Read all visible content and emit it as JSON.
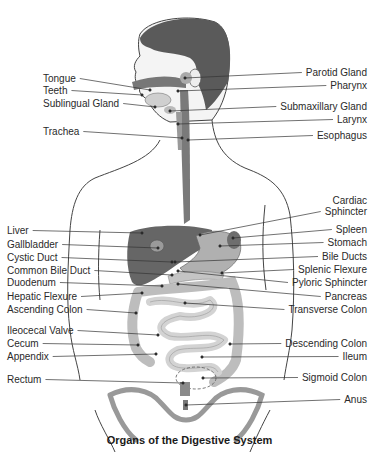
{
  "diagram": {
    "caption": "Organs of the Digestive System",
    "colors": {
      "hair": "#555555",
      "organ_dark": "#666666",
      "organ_mid": "#9a9a9a",
      "intestine": "#d6d6d6",
      "outline": "#444444",
      "leader": "#333333"
    },
    "left_labels": [
      {
        "id": "tongue",
        "text": "Tongue",
        "x": 43,
        "y": 78,
        "px": 150,
        "py": 90
      },
      {
        "id": "teeth",
        "text": "Teeth",
        "x": 43,
        "y": 90,
        "px": 142,
        "py": 95
      },
      {
        "id": "sublingual-gland",
        "text": "Sublingual Gland",
        "x": 43,
        "y": 103,
        "px": 155,
        "py": 107
      },
      {
        "id": "trachea",
        "text": "Trachea",
        "x": 43,
        "y": 131,
        "px": 182,
        "py": 138
      },
      {
        "id": "liver",
        "text": "Liver",
        "x": 7,
        "y": 230,
        "px": 142,
        "py": 233
      },
      {
        "id": "gallbladder",
        "text": "Gallbladder",
        "x": 7,
        "y": 244,
        "px": 158,
        "py": 248
      },
      {
        "id": "cystic-duct",
        "text": "Cystic Duct",
        "x": 7,
        "y": 257,
        "px": 172,
        "py": 262
      },
      {
        "id": "common-bile-duct",
        "text": "Common Bile Duct",
        "x": 7,
        "y": 270,
        "px": 172,
        "py": 275
      },
      {
        "id": "duodenum",
        "text": "Duodenum",
        "x": 7,
        "y": 282,
        "px": 162,
        "py": 286
      },
      {
        "id": "hepatic-flexure",
        "text": "Hepatic Flexure",
        "x": 7,
        "y": 296,
        "px": 142,
        "py": 293
      },
      {
        "id": "ascending-colon",
        "text": "Ascending Colon",
        "x": 7,
        "y": 309,
        "px": 136,
        "py": 313
      },
      {
        "id": "ileocecal-valve",
        "text": "Ileocecal Valve",
        "x": 7,
        "y": 330,
        "px": 158,
        "py": 335
      },
      {
        "id": "cecum",
        "text": "Cecum",
        "x": 7,
        "y": 343,
        "px": 138,
        "py": 345
      },
      {
        "id": "appendix",
        "text": "Appendix",
        "x": 7,
        "y": 356,
        "px": 156,
        "py": 354
      },
      {
        "id": "rectum",
        "text": "Rectum",
        "x": 7,
        "y": 379,
        "px": 183,
        "py": 383
      }
    ],
    "right_labels": [
      {
        "id": "parotid-gland",
        "text": "Parotid Gland",
        "x": 367,
        "y": 72,
        "px": 185,
        "py": 78
      },
      {
        "id": "pharynx",
        "text": "Pharynx",
        "x": 367,
        "y": 85,
        "px": 178,
        "py": 91
      },
      {
        "id": "submaxillary-gland",
        "text": "Submaxillary Gland",
        "x": 367,
        "y": 106,
        "px": 170,
        "py": 111
      },
      {
        "id": "larynx",
        "text": "Larynx",
        "x": 367,
        "y": 119,
        "px": 178,
        "py": 124
      },
      {
        "id": "esophagus",
        "text": "Esophagus",
        "x": 367,
        "y": 135,
        "px": 188,
        "py": 140
      },
      {
        "id": "cardiac-sphincter",
        "text": "Cardiac\nSphincter",
        "x": 367,
        "y": 200,
        "px": 200,
        "py": 235
      },
      {
        "id": "spleen",
        "text": "Spleen",
        "x": 367,
        "y": 229,
        "px": 233,
        "py": 238
      },
      {
        "id": "stomach",
        "text": "Stomach",
        "x": 367,
        "y": 242,
        "px": 220,
        "py": 246
      },
      {
        "id": "bile-ducts",
        "text": "Bile Ducts",
        "x": 367,
        "y": 256,
        "px": 175,
        "py": 262
      },
      {
        "id": "splenic-flexure",
        "text": "Splenic Flexure",
        "x": 367,
        "y": 269,
        "px": 222,
        "py": 273
      },
      {
        "id": "pyloric-sphincter",
        "text": "Pyloric Sphincter",
        "x": 367,
        "y": 282,
        "px": 178,
        "py": 271
      },
      {
        "id": "pancreas",
        "text": "Pancreas",
        "x": 367,
        "y": 296,
        "px": 178,
        "py": 284
      },
      {
        "id": "transverse-colon",
        "text": "Transverse Colon",
        "x": 367,
        "y": 309,
        "px": 185,
        "py": 303
      },
      {
        "id": "descending-colon",
        "text": "Descending Colon",
        "x": 367,
        "y": 343,
        "px": 230,
        "py": 344
      },
      {
        "id": "ileum",
        "text": "Ileum",
        "x": 367,
        "y": 356,
        "px": 202,
        "py": 357
      },
      {
        "id": "sigmoid-colon",
        "text": "Sigmoid Colon",
        "x": 367,
        "y": 377,
        "px": 203,
        "py": 378
      },
      {
        "id": "anus",
        "text": "Anus",
        "x": 367,
        "y": 399,
        "px": 186,
        "py": 405
      }
    ]
  }
}
